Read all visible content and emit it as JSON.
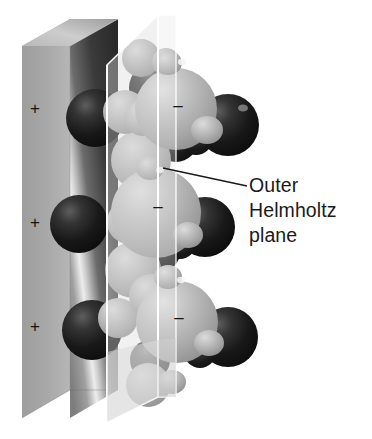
{
  "figure": {
    "title_text_visible": false,
    "background_color": "#ffffff",
    "type": "scientific-illustration"
  },
  "annotation": {
    "label_lines": [
      "Outer",
      "Helmholtz",
      "plane"
    ],
    "line_1": "Outer",
    "line_2": "Helmholtz",
    "line_3": "plane",
    "text_color": "#1a1a1a",
    "leader_line": {
      "name": "leader-line",
      "color": "#1a1a1a",
      "x1": 163,
      "y1": 168,
      "x2": 247,
      "y2": 186
    }
  },
  "electrode": {
    "name": "electrode-slab",
    "charge_symbol": "+",
    "charge_count": 3,
    "charges": [
      {
        "symbol": "+",
        "x": 27,
        "y": 100
      },
      {
        "symbol": "+",
        "x": 27,
        "y": 214
      },
      {
        "symbol": "+",
        "x": 27,
        "y": 318
      }
    ],
    "face_color": "#a8a8a8",
    "front_color": "#4a4a4a",
    "top_color": "#c4c4c4",
    "highlight_color": "#f2f2f2"
  },
  "helmholtz_plane": {
    "name": "outer-helmholtz-plane",
    "fill_color": "#d8d8d8",
    "edge_color": "#ffffff",
    "opacity": 0.42,
    "panels": 2
  },
  "species": {
    "anion_color": "#1c1c1c",
    "solvated_color": "#b4b4b4",
    "water_color": "#c0c0c0",
    "negative_symbol": "–",
    "negative_marks": [
      {
        "symbol": "–",
        "x": 170,
        "y": 97
      },
      {
        "symbol": "–",
        "x": 150,
        "y": 198
      },
      {
        "symbol": "–",
        "x": 171,
        "y": 309
      }
    ],
    "dark_spheres": [
      {
        "cx": 95,
        "cy": 118,
        "r": 29
      },
      {
        "cx": 79,
        "cy": 224,
        "r": 29
      },
      {
        "cx": 92,
        "cy": 330,
        "r": 30
      },
      {
        "cx": 155,
        "cy": 88,
        "r": 26
      },
      {
        "cx": 228,
        "cy": 125,
        "r": 31
      },
      {
        "cx": 205,
        "cy": 227,
        "r": 30
      },
      {
        "cx": 228,
        "cy": 337,
        "r": 30
      },
      {
        "cx": 176,
        "cy": 140,
        "r": 22
      },
      {
        "cx": 160,
        "cy": 252,
        "r": 20
      }
    ],
    "light_spheres": [
      {
        "cx": 176,
        "cy": 109,
        "r": 41
      },
      {
        "cx": 156,
        "cy": 213,
        "r": 45
      },
      {
        "cx": 177,
        "cy": 322,
        "r": 41
      },
      {
        "cx": 141,
        "cy": 160,
        "r": 30
      },
      {
        "cx": 133,
        "cy": 270,
        "r": 28
      }
    ]
  }
}
